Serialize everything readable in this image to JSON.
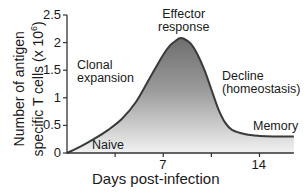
{
  "chart_data": {
    "type": "area",
    "title": "",
    "xlabel": "Days  post-infection",
    "ylabel": "Number of antigen specific T cells (x 10⁶)",
    "ylabel_line1": "Number of antigen",
    "ylabel_line2": "specific T cells (x 10⁶)",
    "xlim": [
      0,
      16.5
    ],
    "ylim": [
      0,
      2.5
    ],
    "x_ticks": [
      3.5,
      7,
      10.5,
      14
    ],
    "x_tick_labels": [
      "",
      "7",
      "",
      "14"
    ],
    "y_ticks": [
      0,
      0.5,
      1,
      1.5,
      2,
      2.5
    ],
    "y_tick_labels": [
      "0",
      "0.5",
      "1",
      "1.5",
      "2",
      "2.5"
    ],
    "grid": false,
    "series": [
      {
        "name": "T cell response",
        "x": [
          0,
          1,
          2,
          3,
          4,
          5,
          6,
          7,
          7.5,
          8,
          8.2,
          8.5,
          9,
          9.5,
          10,
          10.5,
          11,
          11.5,
          12,
          13,
          14,
          15,
          16.5
        ],
        "values": [
          0,
          0.12,
          0.26,
          0.42,
          0.62,
          0.92,
          1.35,
          1.78,
          1.95,
          2.05,
          2.08,
          2.07,
          1.98,
          1.78,
          1.5,
          1.15,
          0.8,
          0.55,
          0.42,
          0.34,
          0.31,
          0.3,
          0.3
        ]
      }
    ],
    "annotations": [
      {
        "text": "Naive",
        "x": 1.8,
        "y": 0.1
      },
      {
        "text": "Clonal expansion",
        "x": 1.5,
        "y": 1.3
      },
      {
        "text": "Effector response",
        "x": 8.2,
        "y": 2.3
      },
      {
        "text": "Decline (homeostasis)",
        "x": 12.5,
        "y": 1.15
      },
      {
        "text": "Memory",
        "x": 14.8,
        "y": 0.5
      }
    ],
    "fill": "gradient gray (dark top to white bottom)",
    "line_color": "#3a3a3a"
  },
  "labels": {
    "naive": "Naive",
    "clonal1": "Clonal",
    "clonal2": "expansion",
    "effector1": "Effector",
    "effector2": "response",
    "decline1": "Decline",
    "decline2": "(homeostasis)",
    "memory": "Memory"
  },
  "axis": {
    "y_line1": "Number of antigen",
    "y_line2": "specific T cells (x 10⁶)",
    "x_title": "Days  post-infection",
    "y_ticks": [
      "0",
      "0.5",
      "1",
      "1.5",
      "2",
      "2.5"
    ],
    "x_ticks": [
      "7",
      "14"
    ]
  }
}
